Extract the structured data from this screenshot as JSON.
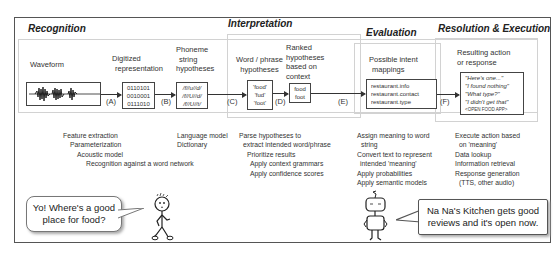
{
  "stages": [
    {
      "id": "recognition",
      "title": "Recognition"
    },
    {
      "id": "interpretation",
      "title": "Interpretation"
    },
    {
      "id": "evaluation",
      "title": "Evaluation"
    },
    {
      "id": "resolution",
      "title": "Resolution & Execution"
    }
  ],
  "nodes": {
    "waveform": {
      "label": "Waveform"
    },
    "digitized": {
      "label_lines": [
        "Digitized",
        "representation"
      ],
      "content": [
        "0110101",
        "0010001",
        "0111010"
      ]
    },
    "phoneme": {
      "label_lines": [
        "Phoneme",
        "string",
        "hypotheses"
      ],
      "content": [
        "/f//u//d/",
        "/f//U//d/",
        "/f//U//t/"
      ]
    },
    "word_phrase": {
      "label_lines": [
        "Word / phrase",
        "hypotheses"
      ],
      "content": [
        "'food'",
        "'fud'",
        "'foot'"
      ]
    },
    "ranked": {
      "label_lines": [
        "Ranked",
        "hypotheses",
        "based on",
        "context"
      ],
      "content": [
        "food",
        "foot"
      ]
    },
    "intent": {
      "label_lines": [
        "Possible intent",
        "mappings"
      ],
      "content": [
        "restaurant.info",
        "restaurant.contact",
        "restaurant.type"
      ]
    },
    "response": {
      "label_lines": [
        "Resulting action",
        "or response"
      ],
      "content": [
        "\"Here's one...\"",
        "\"I found nothing\"",
        "\"What type?\"",
        "\"I didn't get that\"",
        "<OPEN FOOD APP>"
      ]
    }
  },
  "steps": [
    "(A)",
    "(B)",
    "(C)",
    "(D)",
    "(E)",
    "(F)"
  ],
  "descriptions": {
    "recognition_a": [
      "Feature extraction",
      "Parameterization",
      "Acoustic model",
      "Recognition against a word network"
    ],
    "recognition_b": [
      "Language model",
      "Dictionary"
    ],
    "interpretation": [
      "Parse hypotheses to",
      "extract intended word/phrase",
      "Prioritize results",
      "Apply context grammars",
      "Apply confidence scores"
    ],
    "evaluation": [
      "Assign meaning to word",
      "string",
      "Convert text to represent",
      "intended 'meaning'",
      "Apply probabilities",
      "Apply semantic models"
    ],
    "resolution": [
      "Execute action based",
      "on 'meaning'",
      "Data lookup",
      "Information retrieval",
      "Response generation",
      "(TTS, other audio)"
    ]
  },
  "dialogue": {
    "user": [
      "Yo! Where's a good",
      "place for food?"
    ],
    "assistant": [
      "Na Na's Kitchen gets good",
      "reviews and it's open now."
    ]
  }
}
